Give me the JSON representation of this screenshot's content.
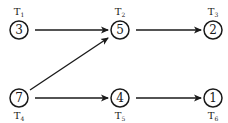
{
  "diagram": {
    "type": "directed-graph",
    "nodes": [
      {
        "id": "T1",
        "value": "3",
        "label": "T",
        "sub": "1",
        "x": 19,
        "y": 30,
        "label_pos": "above"
      },
      {
        "id": "T2",
        "value": "5",
        "label": "T",
        "sub": "2",
        "x": 120,
        "y": 30,
        "label_pos": "above"
      },
      {
        "id": "T3",
        "value": "2",
        "label": "T",
        "sub": "3",
        "x": 213,
        "y": 30,
        "label_pos": "above"
      },
      {
        "id": "T4",
        "value": "7",
        "label": "T",
        "sub": "4",
        "x": 19,
        "y": 98,
        "label_pos": "below"
      },
      {
        "id": "T5",
        "value": "4",
        "label": "T",
        "sub": "5",
        "x": 120,
        "y": 98,
        "label_pos": "below"
      },
      {
        "id": "T6",
        "value": "1",
        "label": "T",
        "sub": "6",
        "x": 213,
        "y": 98,
        "label_pos": "below"
      }
    ],
    "edges": [
      {
        "from": "T1",
        "to": "T2"
      },
      {
        "from": "T2",
        "to": "T3"
      },
      {
        "from": "T4",
        "to": "T2"
      },
      {
        "from": "T4",
        "to": "T5"
      },
      {
        "from": "T5",
        "to": "T6"
      }
    ],
    "colors": {
      "stroke": "#1a1a1a",
      "background": "#ffffff"
    }
  }
}
